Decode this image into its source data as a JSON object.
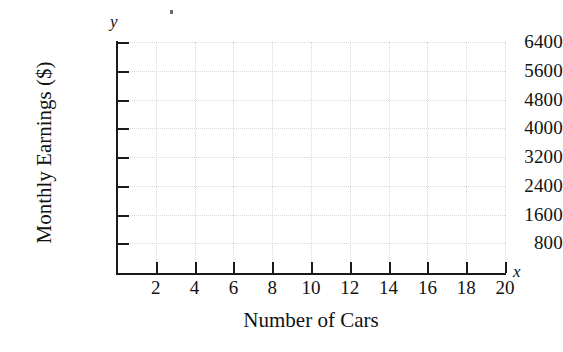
{
  "chart_data": {
    "type": "scatter",
    "title": "",
    "subtitle": "",
    "xlabel": "Number of Cars",
    "ylabel": "Monthly Earnings ($)",
    "x_axis_symbol": "x",
    "y_axis_symbol": "y",
    "xlim": [
      0,
      20
    ],
    "ylim": [
      0,
      6400
    ],
    "x_ticks": [
      2,
      4,
      6,
      8,
      10,
      12,
      14,
      16,
      18,
      20
    ],
    "x_tick_labels": [
      "2",
      "4",
      "6",
      "8",
      "10",
      "12",
      "14",
      "16",
      "18",
      "20"
    ],
    "y_ticks": [
      800,
      1600,
      2400,
      3200,
      4000,
      4800,
      5600,
      6400
    ],
    "y_tick_labels": [
      "800",
      "1600",
      "2400",
      "3200",
      "4000",
      "4800",
      "5600",
      "6400"
    ],
    "x_tick_step": 2,
    "y_tick_step": 800,
    "grid": true,
    "grid_style": "dotted",
    "grid_color": "#d8d8d8",
    "legend": null,
    "series": [],
    "values": [],
    "annotations": [],
    "note": "Empty coordinate grid with no plotted data points"
  },
  "colors": {
    "axis": "#1a1a1a",
    "grid": "#d8d8d8",
    "text": "#121212",
    "background": "#ffffff"
  }
}
